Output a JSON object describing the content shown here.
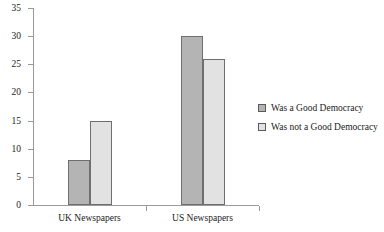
{
  "chart_data": {
    "type": "bar",
    "title": "",
    "subtitle": "",
    "xlabel": "",
    "ylabel": "",
    "ylim": [
      0,
      35
    ],
    "yticks": [
      0,
      5,
      10,
      15,
      20,
      25,
      30,
      35
    ],
    "grid": false,
    "legend_position": "right",
    "categories": [
      "UK Newspapers",
      "US Newspapers"
    ],
    "series": [
      {
        "name": "Was a Good Democracy",
        "color": "#b4b4b4",
        "values": [
          8,
          30
        ]
      },
      {
        "name": "Was not a Good Democracy",
        "color": "#e2e2e2",
        "values": [
          15,
          26
        ]
      }
    ]
  },
  "axis": {
    "tick_labels": [
      "35",
      "30",
      "25",
      "20",
      "15",
      "10",
      "5",
      "0"
    ],
    "line_color": "#9a9a9a"
  },
  "legend": {
    "items": [
      {
        "label": "Was a Good Democracy",
        "color": "#b4b4b4"
      },
      {
        "label": "Was not a Good Democracy",
        "color": "#e2e2e2"
      }
    ]
  },
  "categories": [
    {
      "label": "UK Newspapers"
    },
    {
      "label": "US Newspapers"
    }
  ]
}
